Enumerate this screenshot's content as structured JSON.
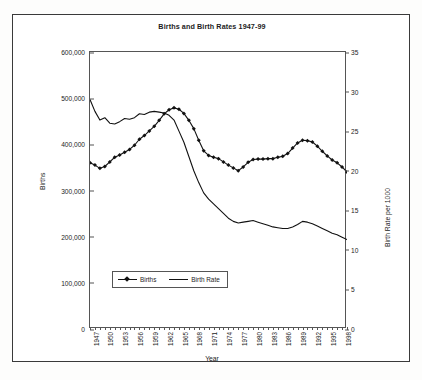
{
  "chart_data": {
    "type": "line",
    "title": "Births and Birth Rates 1947-99",
    "xlabel": "Year",
    "ylabel": "Births",
    "y2label": "Birth Rate per 1000",
    "ylim": [
      0,
      600000
    ],
    "y2lim": [
      0,
      35
    ],
    "ytick_labels": [
      "600,000",
      "500,000",
      "400,000",
      "300,000",
      "200,000",
      "100,000",
      "0"
    ],
    "ytick_values": [
      600000,
      500000,
      400000,
      300000,
      200000,
      100000,
      0
    ],
    "y2tick_labels": [
      "35",
      "30",
      "25",
      "20",
      "15",
      "10",
      "5",
      "0"
    ],
    "y2tick_values": [
      35,
      30,
      25,
      20,
      15,
      10,
      5,
      0
    ],
    "grid": false,
    "legend_position": "inside-lower-left",
    "xtick_labels": [
      "1947",
      "1950",
      "1953",
      "1956",
      "1959",
      "1962",
      "1965",
      "1968",
      "1971",
      "1974",
      "1977",
      "1980",
      "1983",
      "1986",
      "1989",
      "1992",
      "1995",
      "1998"
    ],
    "x": [
      1947,
      1948,
      1949,
      1950,
      1951,
      1952,
      1953,
      1954,
      1955,
      1956,
      1957,
      1958,
      1959,
      1960,
      1961,
      1962,
      1963,
      1964,
      1965,
      1966,
      1967,
      1968,
      1969,
      1970,
      1971,
      1972,
      1973,
      1974,
      1975,
      1976,
      1977,
      1978,
      1979,
      1980,
      1981,
      1982,
      1983,
      1984,
      1985,
      1986,
      1987,
      1988,
      1989,
      1990,
      1991,
      1992,
      1993,
      1994,
      1995,
      1996,
      1997,
      1998,
      1999
    ],
    "series": [
      {
        "name": "Births",
        "axis": "left",
        "marker": "diamond",
        "values": [
          360000,
          355000,
          348000,
          352000,
          362000,
          372000,
          377000,
          383000,
          389000,
          398000,
          411000,
          419000,
          429000,
          439000,
          452000,
          466000,
          475000,
          479000,
          476000,
          467000,
          452000,
          434000,
          409000,
          386000,
          376000,
          372000,
          369000,
          362000,
          355000,
          349000,
          343000,
          351000,
          361000,
          367000,
          368000,
          368000,
          369000,
          369000,
          372000,
          374000,
          380000,
          392000,
          403000,
          409000,
          408000,
          405000,
          396000,
          385000,
          375000,
          366000,
          360000,
          351000,
          340000
        ]
      },
      {
        "name": "Birth Rate",
        "axis": "right",
        "marker": "none",
        "values": [
          29.0,
          27.5,
          26.4,
          26.7,
          26.0,
          25.9,
          26.2,
          26.6,
          26.5,
          26.7,
          27.2,
          27.1,
          27.4,
          27.5,
          27.4,
          27.3,
          27.0,
          26.4,
          25.0,
          23.6,
          21.8,
          20.0,
          18.5,
          17.2,
          16.4,
          15.8,
          15.2,
          14.6,
          14.0,
          13.6,
          13.4,
          13.5,
          13.6,
          13.7,
          13.5,
          13.3,
          13.1,
          12.9,
          12.8,
          12.7,
          12.7,
          12.9,
          13.2,
          13.6,
          13.5,
          13.3,
          13.0,
          12.7,
          12.4,
          12.1,
          11.9,
          11.6,
          11.3
        ]
      }
    ]
  },
  "legend": {
    "entries": [
      {
        "label": "Births"
      },
      {
        "label": "Birth Rate"
      }
    ]
  }
}
